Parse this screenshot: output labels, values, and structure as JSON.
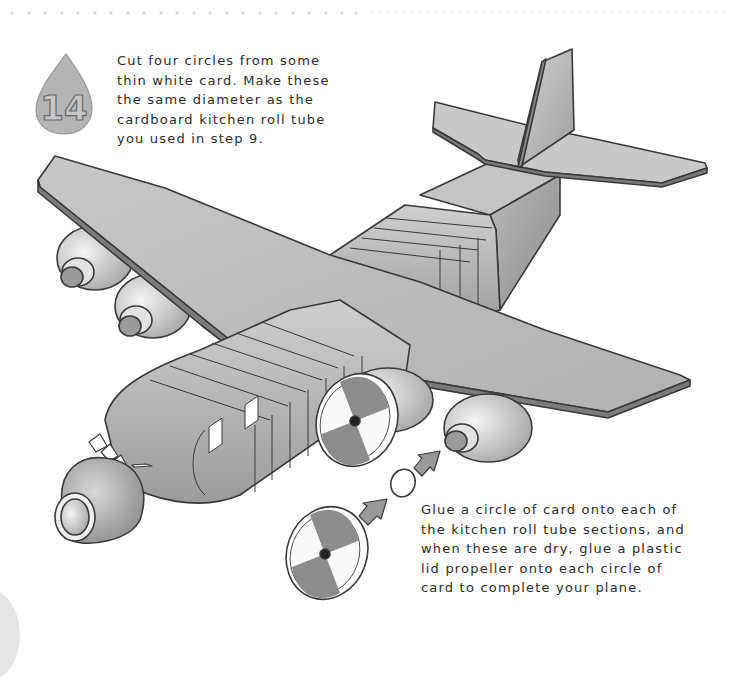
{
  "page": {
    "background": "#ffffff",
    "accent_gray": "#a8a8a8",
    "outline": "#3a3a3a"
  },
  "step": {
    "number": "14",
    "badge_shape": "teardrop",
    "instruction": "Cut four circles from some\nthin white card. Make these\nthe same diameter as the\ncardboard kitchen roll tube\nyou used in step 9."
  },
  "final_instruction": {
    "text": "Glue a circle of card onto each of\nthe kitchen roll tube sections, and\nwhen these are dry, glue a plastic\nlid propeller onto each circle of\ncard to complete your plane."
  },
  "illustration": {
    "subject": "cardboard model cargo plane",
    "parts": [
      "fuselage",
      "left-wing",
      "right-wing",
      "tail-fin",
      "tailplane",
      "nose-cone",
      "cockpit-windows",
      "engine-1",
      "engine-2",
      "engine-3",
      "engine-4",
      "propeller-lid",
      "card-circle",
      "arrow"
    ]
  }
}
